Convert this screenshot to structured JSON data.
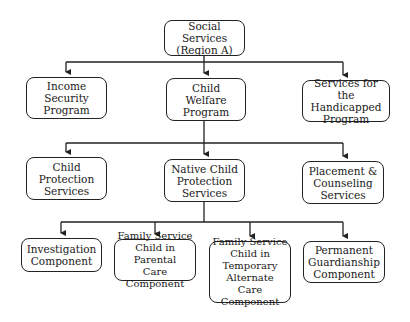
{
  "diagram": {
    "type": "org-chart",
    "root": {
      "id": "social",
      "label": "Social Services\n(Region A)"
    },
    "level1": [
      {
        "id": "income",
        "label": "Income\nSecurity\nProgram"
      },
      {
        "id": "welfare",
        "label": "Child\nWelfare\nProgram"
      },
      {
        "id": "handicapped",
        "label": "Services for\nthe Handicapped\nProgram"
      }
    ],
    "level2": [
      {
        "id": "protection",
        "label": "Child\nProtection\nServices"
      },
      {
        "id": "native",
        "label": "Native Child\nProtection\nServices"
      },
      {
        "id": "placement",
        "label": "Placement &\nCounseling\nServices"
      }
    ],
    "level3": [
      {
        "id": "investigation",
        "label": "Investigation\nComponent"
      },
      {
        "id": "parental",
        "label": "Family Service\nChild in Parental\nCare Component"
      },
      {
        "id": "temporary",
        "label": "Family Service\nChild in\nTemporary\nAlternate\nCare Component"
      },
      {
        "id": "permanent",
        "label": "Permanent\nGuardianship\nComponent"
      }
    ],
    "edges": [
      [
        "social",
        "income"
      ],
      [
        "social",
        "welfare"
      ],
      [
        "social",
        "handicapped"
      ],
      [
        "welfare",
        "protection"
      ],
      [
        "welfare",
        "native"
      ],
      [
        "welfare",
        "placement"
      ],
      [
        "native",
        "investigation"
      ],
      [
        "native",
        "parental"
      ],
      [
        "native",
        "temporary"
      ],
      [
        "native",
        "permanent"
      ]
    ],
    "colors": {
      "line": "#222222",
      "background": "#ffffff"
    }
  }
}
